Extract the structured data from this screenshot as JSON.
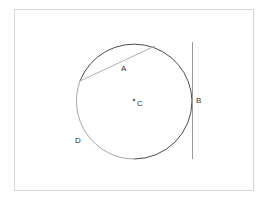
{
  "diagram": {
    "type": "circle-geometry",
    "labels": {
      "chord": "A",
      "tangent_point": "B",
      "center": "C",
      "arc": "D"
    },
    "elements": [
      {
        "id": "circle",
        "kind": "circle",
        "center_label": "C"
      },
      {
        "id": "chord",
        "kind": "line-segment",
        "label": "A",
        "color": "#b0b0b0"
      },
      {
        "id": "tangent",
        "kind": "line",
        "label": "B",
        "color": "#9a9a9a"
      },
      {
        "id": "arc",
        "kind": "arc",
        "label": "D",
        "color": "#a8a8a8"
      }
    ],
    "colors": {
      "circle": "#4a4a4a",
      "chord": "#b0b0b0",
      "tangent": "#9a9a9a",
      "arc_highlight": "#a8a8a8",
      "frame": "#d6d6d6"
    }
  }
}
